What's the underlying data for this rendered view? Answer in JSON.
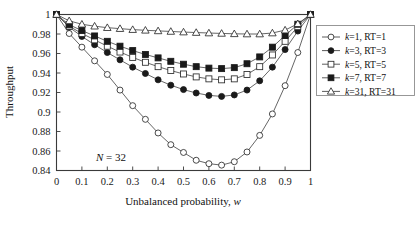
{
  "figure": {
    "background_color": "#ffffff",
    "annotation": "N = 32",
    "annotation_n_italic": "N",
    "annotation_n_value": " = 32"
  },
  "axes": {
    "y_title": "Throughput",
    "x_title_main": "Unbalanced probability, ",
    "x_title_var": "w",
    "x_ticks": [
      "0",
      "0.1",
      "0.2",
      "0.3",
      "0.4",
      "0.5",
      "0.6",
      "0.7",
      "0.8",
      "0.9",
      "1"
    ],
    "y_ticks": [
      "0.84",
      "0.86",
      "0.88",
      "0.9",
      "0.92",
      "0.94",
      "0.96",
      "0.98",
      "1"
    ]
  },
  "legend": {
    "position": "right",
    "items": [
      {
        "label": "k=1, RT=1",
        "k": "k",
        "rest": "=1, RT=1",
        "marker": "open-circle",
        "color": "#1a1a1a"
      },
      {
        "label": "k=3, RT=3",
        "k": "k",
        "rest": "=3, RT=3",
        "marker": "filled-circle",
        "color": "#1a1a1a"
      },
      {
        "label": "k=5, RT=5",
        "k": "k",
        "rest": "=5, RT=5",
        "marker": "open-square",
        "color": "#1a1a1a"
      },
      {
        "label": "k=7, RT=7",
        "k": "k",
        "rest": "=7, RT=7",
        "marker": "filled-square",
        "color": "#1a1a1a"
      },
      {
        "label": "k=31, RT=31",
        "k": "k",
        "rest": "=31, RT=31",
        "marker": "open-triangle",
        "color": "#1a1a1a"
      }
    ]
  },
  "chart_data": {
    "type": "line",
    "title": "",
    "xlabel": "Unbalanced probability, w",
    "ylabel": "Throughput",
    "xlim": [
      0,
      1
    ],
    "ylim": [
      0.84,
      1.0
    ],
    "xticks": [
      0,
      0.1,
      0.2,
      0.3,
      0.4,
      0.5,
      0.6,
      0.7,
      0.8,
      0.9,
      1
    ],
    "yticks": [
      0.84,
      0.86,
      0.88,
      0.9,
      0.92,
      0.94,
      0.96,
      0.98,
      1
    ],
    "grid": false,
    "legend_position": "right-outside",
    "annotations": [
      {
        "text": "N = 32",
        "x": 0.16,
        "y": 0.857
      }
    ],
    "x": [
      0,
      0.05,
      0.1,
      0.15,
      0.2,
      0.25,
      0.3,
      0.35,
      0.4,
      0.45,
      0.5,
      0.55,
      0.6,
      0.65,
      0.7,
      0.75,
      0.8,
      0.85,
      0.9,
      0.95,
      1
    ],
    "series": [
      {
        "name": "k=1, RT=1",
        "marker": "open-circle",
        "values": [
          1.0,
          0.9805,
          0.9665,
          0.9525,
          0.9385,
          0.9225,
          0.9065,
          0.8925,
          0.8785,
          0.8665,
          0.8585,
          0.8505,
          0.847,
          0.8455,
          0.849,
          0.859,
          0.876,
          0.898,
          0.927,
          0.961,
          1.0
        ]
      },
      {
        "name": "k=3, RT=3",
        "marker": "filled-circle",
        "values": [
          1.0,
          0.987,
          0.9775,
          0.969,
          0.961,
          0.9535,
          0.946,
          0.9395,
          0.933,
          0.9275,
          0.923,
          0.9195,
          0.917,
          0.916,
          0.9175,
          0.9225,
          0.932,
          0.946,
          0.964,
          0.983,
          1.0
        ]
      },
      {
        "name": "k=5, RT=5",
        "marker": "open-square",
        "values": [
          1.0,
          0.988,
          0.9805,
          0.974,
          0.9675,
          0.9615,
          0.956,
          0.951,
          0.9465,
          0.9425,
          0.939,
          0.936,
          0.934,
          0.933,
          0.934,
          0.9385,
          0.9465,
          0.9585,
          0.9725,
          0.9875,
          1.0
        ]
      },
      {
        "name": "k=7, RT=7",
        "marker": "filled-square",
        "values": [
          1.0,
          0.9895,
          0.9835,
          0.978,
          0.9725,
          0.9675,
          0.963,
          0.959,
          0.9555,
          0.952,
          0.949,
          0.9465,
          0.945,
          0.9445,
          0.9455,
          0.9495,
          0.9565,
          0.9665,
          0.9785,
          0.99,
          1.0
        ]
      },
      {
        "name": "k=31, RT=31",
        "marker": "open-triangle",
        "values": [
          1.0,
          0.9935,
          0.99,
          0.988,
          0.9865,
          0.9855,
          0.9845,
          0.9838,
          0.9832,
          0.9826,
          0.982,
          0.9815,
          0.981,
          0.9806,
          0.9802,
          0.98,
          0.98,
          0.981,
          0.984,
          0.9905,
          1.0
        ]
      }
    ]
  }
}
